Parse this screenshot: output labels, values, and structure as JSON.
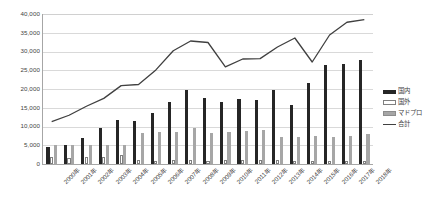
{
  "chart_data": {
    "type": "bar",
    "title": "",
    "xlabel": "",
    "ylabel": "",
    "ylim": [
      0,
      40000
    ],
    "ytick_step": 5000,
    "grid": true,
    "legend_position": "right",
    "yticks": [
      "40,000",
      "35,000",
      "30,000",
      "25,000",
      "20,000",
      "15,000",
      "10,000",
      "5,000",
      "0"
    ],
    "ytick_values": [
      40000,
      35000,
      30000,
      25000,
      20000,
      15000,
      10000,
      5000,
      0
    ],
    "categories": [
      "2000年",
      "2001年",
      "2002年",
      "2003年",
      "2004年",
      "2005年",
      "2006年",
      "2007年",
      "2008年",
      "2009年",
      "2010年",
      "2011年",
      "2012年",
      "2013年",
      "2014年",
      "2015年",
      "2016年",
      "2017年",
      "2018年"
    ],
    "series": [
      {
        "name": "国内",
        "kind": "bar",
        "color": "#262626",
        "values": [
          4500,
          5000,
          6900,
          9500,
          11700,
          11600,
          13500,
          16600,
          19800,
          17500,
          16500,
          17300,
          17000,
          19700,
          15700,
          21500,
          26400,
          26700,
          27800
        ]
      },
      {
        "name": "国外",
        "kind": "bar",
        "color": "#ffffff",
        "values": [
          1900,
          1700,
          1800,
          2000,
          2500,
          1000,
          900,
          1100,
          1200,
          900,
          1000,
          1100,
          1000,
          1100,
          900,
          700,
          700,
          700,
          700
        ]
      },
      {
        "name": "マドプロ",
        "kind": "bar",
        "color": "#a6a6a6",
        "values": [
          5000,
          5100,
          5100,
          5000,
          5200,
          8300,
          8500,
          8600,
          9600,
          8400,
          8500,
          8800,
          9000,
          7200,
          7300,
          7400,
          7300,
          7400,
          8000
        ]
      },
      {
        "name": "合計",
        "kind": "line",
        "color": "#404040",
        "values": [
          11300,
          13000,
          15400,
          17500,
          20900,
          21200,
          25100,
          30200,
          32800,
          32400,
          25900,
          28000,
          28100,
          31200,
          33600,
          27200,
          34400,
          37800,
          38500
        ]
      }
    ],
    "legend": [
      {
        "label": "国内",
        "swatch": "domestic"
      },
      {
        "label": "国外",
        "swatch": "foreign"
      },
      {
        "label": "マドプロ",
        "swatch": "madrid"
      },
      {
        "label": "合計",
        "swatch": "total"
      }
    ]
  }
}
